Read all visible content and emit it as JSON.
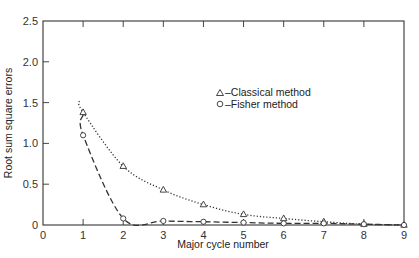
{
  "chart_data": {
    "type": "line",
    "title": "",
    "xlabel": "Major cycle number",
    "ylabel": "Root sum square errors",
    "xlim": [
      0,
      9
    ],
    "ylim": [
      0,
      2.5
    ],
    "x_ticks": [
      "0",
      "1",
      "2",
      "3",
      "4",
      "5",
      "6",
      "7",
      "8",
      "9"
    ],
    "y_ticks": [
      "0",
      "0.5",
      "1.0",
      "1.5",
      "2.0",
      "2.5"
    ],
    "grid": false,
    "legend_position": "upper right (inside)",
    "series": [
      {
        "name": "Classical method",
        "marker": "triangle",
        "line_style": "dotted",
        "x": [
          1,
          2,
          3,
          4,
          5,
          6,
          7,
          8,
          9
        ],
        "values": [
          1.38,
          0.72,
          0.43,
          0.25,
          0.13,
          0.08,
          0.04,
          0.01,
          0.0
        ]
      },
      {
        "name": "Fisher method",
        "marker": "circle",
        "line_style": "dashed",
        "x": [
          1,
          2,
          3,
          4,
          5,
          6,
          7,
          8,
          9
        ],
        "values": [
          1.1,
          0.08,
          0.05,
          0.04,
          0.03,
          0.02,
          0.02,
          0.01,
          0.0
        ]
      }
    ],
    "legend": [
      {
        "symbol": "△",
        "label": "–Classical method"
      },
      {
        "symbol": "○",
        "label": "–Fisher method"
      }
    ]
  }
}
